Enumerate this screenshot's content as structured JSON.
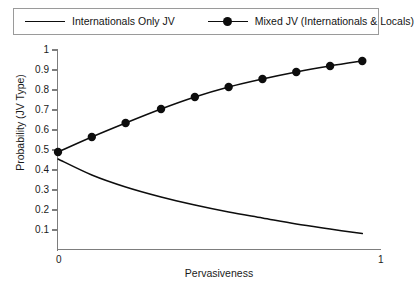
{
  "figure": {
    "background_color": "#ffffff",
    "line_color": "#0d0d0d",
    "axis_color": "#7d7d7d",
    "legend_border_color": "#9a9a9a"
  },
  "legend": {
    "position": "top",
    "entries": [
      {
        "label": "Internationals Only JV",
        "marker": "none",
        "style": "line",
        "color": "#0d0d0d"
      },
      {
        "label": "Mixed JV (Internationals & Locals)",
        "marker": "filled-circle",
        "style": "line-marker",
        "color": "#0d0d0d"
      }
    ]
  },
  "axes": {
    "ylabel": "Probability (JV Type)",
    "xlabel": "Pervasiveness",
    "yticks": [
      "0.1",
      "0.2",
      "0.3",
      "0.4",
      "0.5",
      "0.6",
      "0.7",
      "0.8",
      "0.9",
      "1"
    ],
    "xticks": [
      "0",
      "1"
    ]
  },
  "chart_data": {
    "type": "line",
    "title": "",
    "xlabel": "Pervasiveness",
    "ylabel": "Probability (JV Type)",
    "xlim": [
      0,
      1
    ],
    "ylim": [
      0,
      1
    ],
    "grid": false,
    "legend_position": "top",
    "x": [
      0,
      0.105,
      0.21,
      0.32,
      0.425,
      0.53,
      0.635,
      0.74,
      0.845,
      0.945
    ],
    "series": [
      {
        "name": "Internationals Only JV",
        "marker": "none",
        "color": "#0d0d0d",
        "values": [
          0.455,
          0.375,
          0.315,
          0.265,
          0.225,
          0.19,
          0.16,
          0.13,
          0.105,
          0.082
        ]
      },
      {
        "name": "Mixed JV (Internationals & Locals)",
        "marker": "filled-circle",
        "color": "#0d0d0d",
        "values": [
          0.49,
          0.565,
          0.635,
          0.705,
          0.765,
          0.815,
          0.855,
          0.89,
          0.92,
          0.945
        ]
      }
    ]
  }
}
